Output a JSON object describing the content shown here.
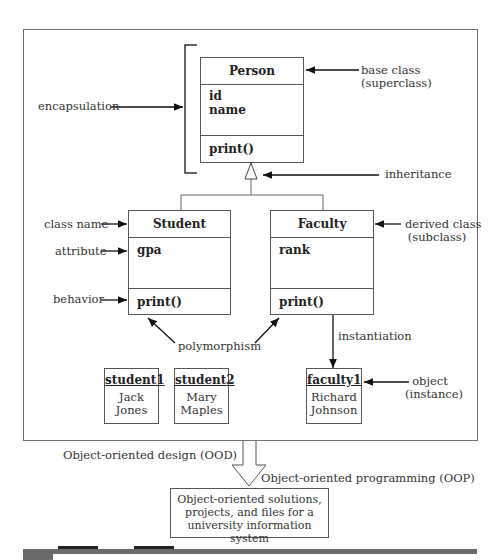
{
  "diagram": {
    "classes": [
      {
        "name": "Person",
        "attributes": [
          "id",
          "name"
        ],
        "methods": [
          "print()"
        ]
      },
      {
        "name": "Student",
        "attributes": [
          "gpa"
        ],
        "methods": [
          "print()"
        ]
      },
      {
        "name": "Faculty",
        "attributes": [
          "rank"
        ],
        "methods": [
          "print()"
        ]
      }
    ],
    "objects": [
      {
        "name": "student1",
        "value_line1": "Jack",
        "value_line2": "Jones"
      },
      {
        "name": "student2",
        "value_line1": "Mary",
        "value_line2": "Maples"
      },
      {
        "name": "faculty1",
        "value_line1": "Richard",
        "value_line2": "Johnson"
      }
    ],
    "labels": {
      "encapsulation": "encapsulation",
      "base_class_line1": "base class",
      "base_class_line2": "(superclass)",
      "inheritance": "inheritance",
      "class_name": "class name",
      "attribute": "attribute",
      "behavior": "behavior",
      "derived_class_line1": "derived class",
      "derived_class_line2": "(subclass)",
      "polymorphism": "polymorphism",
      "instantiation": "instantiation",
      "object_line1": "object",
      "object_line2": "(instance)",
      "ood": "Object-oriented design (OOD)",
      "oop": "Object-oriented programming (OOP)"
    },
    "solutions_box": {
      "line1": "Object-oriented solutions,",
      "line2": "projects, and files for a",
      "line3": "university information system"
    },
    "colors": {
      "line": "#555555",
      "frame": "#6f6f6f",
      "caption_bar": "#6a6a6a"
    }
  }
}
